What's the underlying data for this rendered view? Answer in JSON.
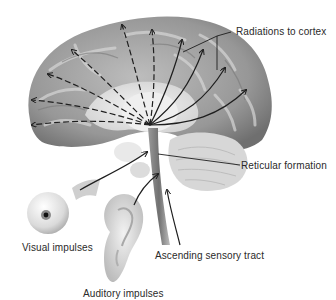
{
  "diagram": {
    "labels": {
      "radiations": "Radiations to cortex",
      "reticular": "Reticular formation",
      "visual": "Visual impulses",
      "auditory": "Auditory impulses",
      "ascending": "Ascending sensory tract"
    },
    "structures": [
      "brain-hemisphere",
      "cerebellum",
      "brainstem",
      "eyeball",
      "ear"
    ],
    "arrows": {
      "dashed_radiations_left": 6,
      "solid_radiations_right": 4,
      "input_arrows": [
        "visual",
        "auditory",
        "ascending"
      ]
    },
    "colors": {
      "cortex": "#8f8f8f",
      "cortex_light": "#c4c4c4",
      "inner": "#e6e6e6",
      "arrow": "#1e1e1e",
      "text": "#2a2a2a"
    }
  }
}
